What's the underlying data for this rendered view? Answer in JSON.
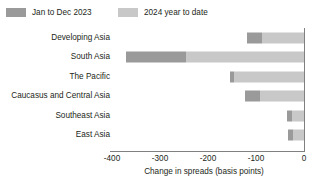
{
  "legend": {
    "items": [
      {
        "label": "Jan to Dec 2023",
        "color": "#9a9a9a",
        "swatch_name": "legend-swatch-2023"
      },
      {
        "label": "2024 year to date",
        "color": "#c8c8c8",
        "swatch_name": "legend-swatch-2024"
      }
    ]
  },
  "axis": {
    "title": "Change in spreads (basis points)",
    "ticks": [
      "-400",
      "-300",
      "-200",
      "-100",
      "0"
    ],
    "tick_values": [
      -400,
      -300,
      -200,
      -100,
      0
    ],
    "min": -400,
    "max": 0
  },
  "chart_data": {
    "type": "bar",
    "orientation": "horizontal",
    "stacked": true,
    "title": "",
    "subtitle": "",
    "xlabel": "Change in spreads (basis points)",
    "ylabel": "",
    "xlim": [
      -400,
      0
    ],
    "xticks": [
      -400,
      -300,
      -200,
      -100,
      0
    ],
    "grid": false,
    "legend_position": "top-left",
    "categories": [
      "Developing Asia",
      "South Asia",
      "The Pacific",
      "Caucasus and Central Asia",
      "Southeast Asia",
      "East Asia"
    ],
    "series": [
      {
        "name": "Jan to Dec 2023",
        "color": "#9a9a9a",
        "values": [
          -31,
          -125,
          -10,
          -31,
          -10,
          -11
        ]
      },
      {
        "name": "2024 year to date",
        "color": "#c8c8c8",
        "values": [
          -88,
          -245,
          -145,
          -92,
          -26,
          -23
        ]
      }
    ],
    "totals": [
      -119,
      -370,
      -155,
      -123,
      -36,
      -34
    ],
    "note": "Bars are stacked leftward from zero; the 2024 year-to-date segment is adjacent to the zero axis and the Jan to Dec 2023 segment forms the far-left end of each bar."
  },
  "rows": [
    {
      "label": "Developing Asia",
      "total": -119,
      "seg2023_start": -119,
      "seg2023_end": -88
    },
    {
      "label": "South Asia",
      "total": -370,
      "seg2023_start": -370,
      "seg2023_end": -245
    },
    {
      "label": "The Pacific",
      "total": -155,
      "seg2023_start": -155,
      "seg2023_end": -145
    },
    {
      "label": "Caucasus and Central Asia",
      "total": -123,
      "seg2023_start": -123,
      "seg2023_end": -92
    },
    {
      "label": "Southeast Asia",
      "total": -36,
      "seg2023_start": -36,
      "seg2023_end": -26
    },
    {
      "label": "East Asia",
      "total": -34,
      "seg2023_start": -34,
      "seg2023_end": -23
    }
  ]
}
